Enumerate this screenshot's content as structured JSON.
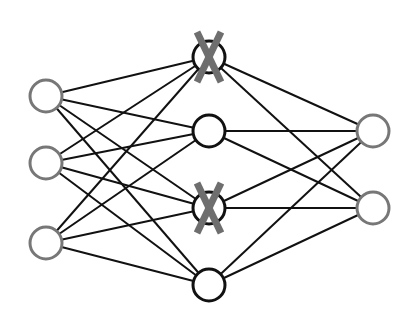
{
  "diagram": {
    "colors": {
      "edge": "#111111",
      "input_stroke": "#777777",
      "hidden_stroke": "#111111",
      "output_stroke": "#777777",
      "node_fill": "#ffffff",
      "dropout_mark": "#6e6e6e"
    },
    "node_radius": 16,
    "layers": [
      {
        "name": "input",
        "x": 46,
        "nodes": [
          {
            "y": 96
          },
          {
            "y": 163
          },
          {
            "y": 243
          }
        ]
      },
      {
        "name": "hidden",
        "x": 209,
        "nodes": [
          {
            "y": 57,
            "dropped": true
          },
          {
            "y": 131
          },
          {
            "y": 208,
            "dropped": true
          },
          {
            "y": 285
          }
        ]
      },
      {
        "name": "output",
        "x": 373,
        "nodes": [
          {
            "y": 131
          },
          {
            "y": 208
          }
        ]
      }
    ],
    "dropout_mark_glyph": "X"
  }
}
